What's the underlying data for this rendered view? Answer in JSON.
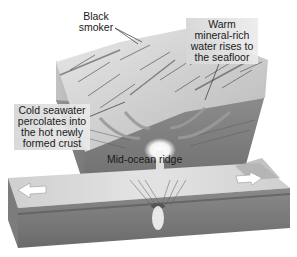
{
  "diagram": {
    "labels": {
      "black_smoker": "Black\nsmoker",
      "warm_water": "Warm\nmineral-rich\nwater rises to\nthe seafloor",
      "cold_seawater": "Cold seawater\npercolates into\nthe hot newly\nformed crust",
      "ridge": "Mid-ocean ridge"
    },
    "arrows": [
      {
        "name": "plate-motion-left",
        "direction": "left"
      },
      {
        "name": "plate-motion-right",
        "direction": "right"
      }
    ],
    "colors": {
      "background": "#ffffff",
      "seafloor_light": "#d8d8d8",
      "crust_dark": "#7a7a7a",
      "magma_glow": "#ffffff",
      "text": "#1a1a1a"
    }
  }
}
